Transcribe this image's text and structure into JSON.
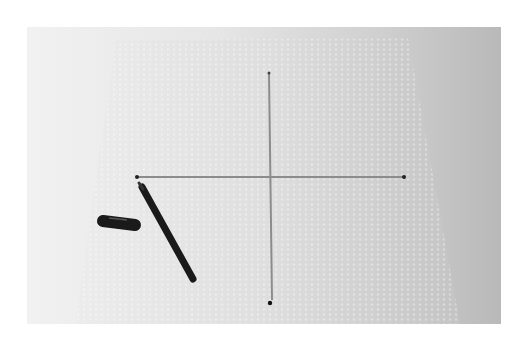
{
  "image": {
    "description": "Photograph of a sheet of bubble wrap on a surface with a cross (horizontal and vertical line) drawn on it, endpoints marked with dots, and a black marker pen with its cap beside it",
    "colors": {
      "background_light": "#f1f1f1",
      "background_dark": "#b9b9b9",
      "sheet": "#dcdcdc",
      "line": "#8a8a8a",
      "marker": "#1a1a1a"
    },
    "objects": [
      {
        "name": "bubble-wrap-sheet"
      },
      {
        "name": "horizontal-line"
      },
      {
        "name": "vertical-line"
      },
      {
        "name": "endpoint-dots",
        "count": 4
      },
      {
        "name": "marker-pen"
      },
      {
        "name": "marker-cap"
      }
    ]
  }
}
